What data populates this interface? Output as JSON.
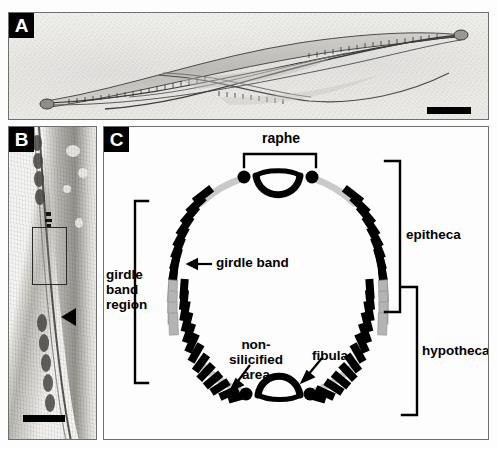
{
  "figure": {
    "panels": [
      {
        "id": "A",
        "letter": "A",
        "caption_icons": {
          "scale_bar": "scale-bar"
        },
        "content": "light micrograph of whole diatom frustule"
      },
      {
        "id": "B",
        "letter": "B",
        "caption_icons": {
          "scale_bar": "scale-bar",
          "arrowhead": "arrowhead-marker",
          "inset": "inset-box"
        },
        "content": "transmission electron micrograph of cell wall in section"
      },
      {
        "id": "C",
        "letter": "C",
        "content": "schematic transverse section of diatom frustule"
      }
    ]
  },
  "diagram": {
    "labels": {
      "raphe": "raphe",
      "girdle_band": "girdle band",
      "girdle_band_region": "girdle\nband\nregion",
      "non_silicified_area": "non-silicified\narea",
      "fibula": "fibula",
      "epitheca": "epitheca",
      "hypotheca": "hypotheca"
    },
    "brackets": [
      {
        "name": "raphe-bracket",
        "orientation": "top",
        "label": "raphe"
      },
      {
        "name": "girdle-band-region-bracket",
        "orientation": "left",
        "label": "girdle band region"
      },
      {
        "name": "epitheca-bracket",
        "orientation": "right",
        "label": "epitheca"
      },
      {
        "name": "hypotheca-bracket",
        "orientation": "right",
        "label": "hypotheca"
      }
    ],
    "pointers": [
      {
        "name": "girdle-band-arrow",
        "target": "girdle band"
      },
      {
        "name": "non-silicified-area-arrow",
        "target": "non-silicified area"
      },
      {
        "name": "fibula-arrow",
        "target": "fibula"
      }
    ],
    "elements": {
      "girdle_band_count_left": 24,
      "girdle_band_count_right": 24,
      "grey_band_count_per_side": 4,
      "raphe_dots": 2,
      "fibula_dots": 2
    }
  },
  "colors": {
    "silicified_band": "#000000",
    "new_band_grey": "#b4b4b4",
    "non_silicified_area": "#c9c9c9",
    "panel_border": "#6f6f6f",
    "panel_letter_bg": "#000000",
    "panel_letter_fg": "#ffffff",
    "diagram_background": "#fdfdfd"
  }
}
